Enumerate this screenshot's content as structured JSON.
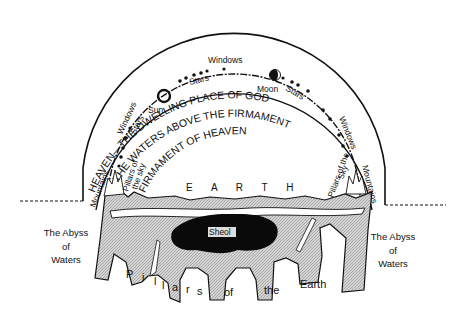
{
  "diagram": {
    "colors": {
      "ink": "#111111",
      "earth_fill": "#c8c8c8",
      "sheol_fill": "#0a0a0a",
      "background": "#ffffff"
    },
    "arcs": {
      "outer_text": "HEAVEN—THE DWELLING PLACE OF GOD",
      "middle_text": "THE WATERS ABOVE THE FIRMAMENT",
      "inner_text": "FIRMAMENT OF HEAVEN"
    },
    "celestial": {
      "sun": "Sun",
      "moon": "Moon",
      "stars": [
        "Stars",
        "Stars",
        "Stars"
      ],
      "windows": [
        "Windows",
        "Windows",
        "Windows"
      ]
    },
    "sides": {
      "left_mountains": "Mountains",
      "right_mountains": "Mountains",
      "left_pillars_line1": "Pillars of",
      "left_pillars_line2": "the sky",
      "right_pillars_line1": "Pillars of the",
      "right_pillars_line2": "Sky"
    },
    "earth": {
      "label": "E A R T H",
      "sheol": "Sheol",
      "pillars": [
        "P",
        "i",
        "l",
        "l",
        "a",
        "r",
        "s",
        "of",
        "the",
        "Earth"
      ]
    },
    "abyss_left": {
      "line1": "The Abyss",
      "line2": "of",
      "line3": "Waters"
    },
    "abyss_right": {
      "line1": "The Abyss",
      "line2": "of",
      "line3": "Waters"
    }
  }
}
